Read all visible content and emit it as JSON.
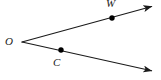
{
  "figure": {
    "kind": "geometry-diagram",
    "background_color": "#ffffff",
    "stroke_color": "#1a1a1a",
    "point_color": "#000000",
    "stroke_width": 1.1,
    "width": 161,
    "height": 80
  },
  "labels": {
    "vertex": "O",
    "upper_point": "W",
    "lower_point": "C"
  },
  "chart_data": {
    "type": "scatter",
    "title": "",
    "xlabel": "",
    "ylabel": "",
    "xlim": [
      0,
      161
    ],
    "ylim": [
      0,
      80
    ],
    "grid": false,
    "legend": "none",
    "points": [
      {
        "name": "O",
        "x": 22,
        "y": 42,
        "marker": "none",
        "label_dx": -13,
        "label_dy": 0
      },
      {
        "name": "W",
        "x": 112,
        "y": 18,
        "marker": "dot",
        "label_dx": -2,
        "label_dy": -14
      },
      {
        "name": "C",
        "x": 61,
        "y": 50,
        "marker": "dot",
        "label_dx": -4,
        "label_dy": 13
      }
    ],
    "series": [
      {
        "name": "ray-OW",
        "type": "ray",
        "from": [
          22,
          42
        ],
        "through": [
          112,
          18
        ],
        "to": [
          157,
          5
        ],
        "arrow_at_end": true
      },
      {
        "name": "ray-OC",
        "type": "ray",
        "from": [
          22,
          42
        ],
        "through": [
          61,
          50
        ],
        "to": [
          157,
          72
        ],
        "arrow_at_end": true
      }
    ]
  }
}
